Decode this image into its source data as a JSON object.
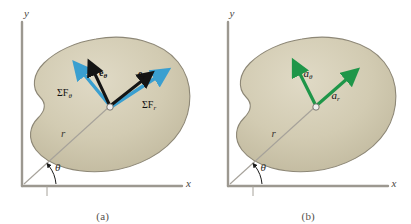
{
  "figure": {
    "blob_color": "#cdc6ad",
    "blob_edge_color": "#8d8776",
    "axis_color": "#9c9890",
    "vector_black": "#141414",
    "vector_blue": "#3a9fd0",
    "vector_green": "#1f9649",
    "particle_color": "#efefef"
  },
  "panels": [
    {
      "id": "a",
      "caption": "(a)",
      "axes": {
        "x_label": "x",
        "y_label": "y"
      },
      "radial": {
        "r_label": "r",
        "theta_label": "θ"
      },
      "vectors": [
        {
          "name": "unit-vector-e-theta",
          "label": "e",
          "sub": "θ",
          "color": "#141414",
          "style": "bold-unit"
        },
        {
          "name": "unit-vector-e-r",
          "label": "e",
          "sub": "r",
          "color": "#141414",
          "style": "bold-unit"
        },
        {
          "name": "force-sum-theta",
          "label": "ΣF",
          "sub": "θ",
          "color": "#3a9fd0",
          "style": "force"
        },
        {
          "name": "force-sum-r",
          "label": "ΣF",
          "sub": "r",
          "color": "#3a9fd0",
          "style": "force"
        }
      ]
    },
    {
      "id": "b",
      "caption": "(b)",
      "axes": {
        "x_label": "x",
        "y_label": "y"
      },
      "radial": {
        "r_label": "r",
        "theta_label": "θ"
      },
      "vectors": [
        {
          "name": "acceleration-theta",
          "label": "a",
          "sub": "θ",
          "color": "#1f9649",
          "style": "accel"
        },
        {
          "name": "acceleration-r",
          "label": "a",
          "sub": "r",
          "color": "#1f9649",
          "style": "accel"
        }
      ]
    }
  ],
  "labels": {
    "a": {
      "x_axis": "x",
      "y_axis": "y",
      "r": "r",
      "theta": "θ",
      "e_theta_base": "e",
      "e_theta_sub": "θ",
      "e_r_base": "e",
      "e_r_sub": "r",
      "sumF_theta_base": "ΣF",
      "sumF_theta_sub": "θ",
      "sumF_r_base": "ΣF",
      "sumF_r_sub": "r",
      "caption": "(a)"
    },
    "b": {
      "x_axis": "x",
      "y_axis": "y",
      "r": "r",
      "theta": "θ",
      "a_theta_base": "a",
      "a_theta_sub": "θ",
      "a_r_base": "a",
      "a_r_sub": "r",
      "caption": "(b)"
    }
  }
}
